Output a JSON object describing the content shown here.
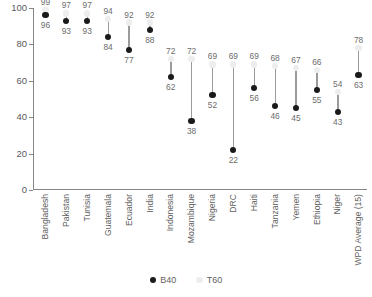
{
  "chart_data": {
    "type": "scatter",
    "title": "",
    "subtitle": "",
    "xlabel": "",
    "ylabel": "",
    "ylim": [
      0,
      100
    ],
    "yticks": [
      0,
      20,
      40,
      60,
      80,
      100
    ],
    "grid": false,
    "legend_position": "bottom",
    "categories": [
      "Bangladesh",
      "Pakistan",
      "Tunisia",
      "Guatemala",
      "Ecuador",
      "India",
      "Indonesia",
      "Mozambique",
      "Nigeria",
      "DRC",
      "Haiti",
      "Tanzania",
      "Yemen",
      "Ethiopia",
      "Niger",
      "WPD Average (15)"
    ],
    "series": [
      {
        "name": "B40",
        "color": "#1a1a1a",
        "values": [
          96,
          93,
          93,
          84,
          77,
          88,
          62,
          38,
          52,
          22,
          56,
          46,
          45,
          55,
          43,
          63
        ]
      },
      {
        "name": "T60",
        "color": "#ededed",
        "values": [
          99,
          97,
          97,
          94,
          92,
          92,
          72,
          72,
          69,
          69,
          69,
          68,
          67,
          66,
          54,
          78
        ]
      }
    ]
  },
  "legend": {
    "items": [
      {
        "label": "B40",
        "marker": "filled-circle-dark"
      },
      {
        "label": "T60",
        "marker": "filled-circle-light"
      }
    ]
  }
}
